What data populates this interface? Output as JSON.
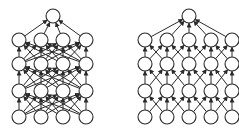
{
  "diagram": {
    "colors": {
      "stroke": "#2a2a2a",
      "node_fill": "#ffffff",
      "background": "#ffffff"
    },
    "node_radius": 7,
    "networks": [
      {
        "id": "fully-connected-network",
        "connectivity": "full",
        "columns_x": [
          19,
          41,
          63,
          86
        ],
        "rows_y": [
          117,
          91,
          64,
          40
        ],
        "output": {
          "x": 53,
          "y": 16
        }
      },
      {
        "id": "locally-connected-network",
        "connectivity": "local",
        "columns_x": [
          145,
          167,
          189,
          211,
          232
        ],
        "rows_y": [
          117,
          91,
          64,
          40
        ],
        "output": {
          "x": 189,
          "y": 16
        }
      }
    ]
  }
}
